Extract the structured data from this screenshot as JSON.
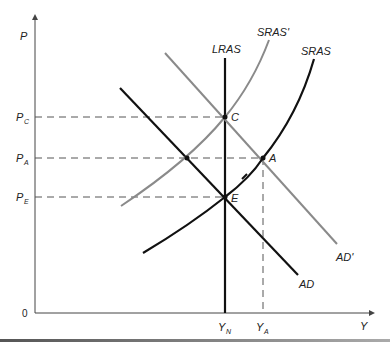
{
  "axes": {
    "y_label": "P",
    "x_label": "Y",
    "origin_label": "0"
  },
  "price_levels": [
    {
      "id": "pc",
      "main": "P",
      "sub": "C"
    },
    {
      "id": "pa",
      "main": "P",
      "sub": "A"
    },
    {
      "id": "pe",
      "main": "P",
      "sub": "E"
    }
  ],
  "output_levels": [
    {
      "id": "yn",
      "main": "Y",
      "sub": "N"
    },
    {
      "id": "ya",
      "main": "Y",
      "sub": "A"
    }
  ],
  "curves": {
    "lras": "LRAS",
    "sras": "SRAS",
    "sras_prime": "SRAS'",
    "ad": "AD",
    "ad_prime": "AD'"
  },
  "points": {
    "c": "C",
    "a": "A",
    "e": "E"
  },
  "colors": {
    "primary_curve": "#111111",
    "shifted_curve": "#8a8a8a",
    "dashed_guide": "#555555",
    "axis": "#444444"
  }
}
